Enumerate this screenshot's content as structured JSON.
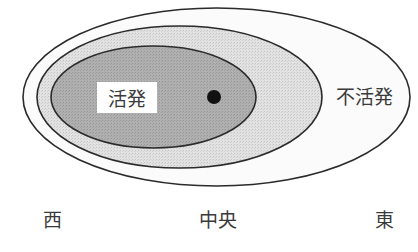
{
  "diagram": {
    "title": "",
    "regions": [
      {
        "id": "outer",
        "label": "不活発",
        "fill": "#fafafa",
        "stroke": "#2b2b2b"
      },
      {
        "id": "middle",
        "label": "",
        "fill": "#d9d9d9",
        "stroke": "#2b2b2b"
      },
      {
        "id": "inner",
        "label": "活発",
        "fill": "#a9a9a9",
        "stroke": "#2b2b2b"
      }
    ],
    "labels": {
      "active": "活発",
      "inactive": "不活発",
      "west": "西",
      "center": "中央",
      "east": "東"
    },
    "marker": {
      "type": "dot",
      "color": "#111111"
    }
  }
}
